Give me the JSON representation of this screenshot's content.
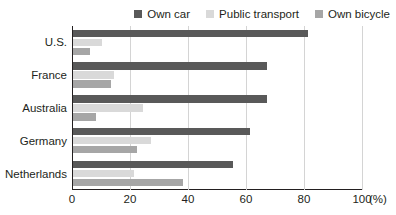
{
  "chart_data": {
    "type": "bar",
    "orientation": "horizontal",
    "title": "",
    "subtitle": "",
    "xlabel": "(%)",
    "ylabel": "",
    "xlim": [
      0,
      100
    ],
    "xticks": [
      0,
      20,
      40,
      60,
      80,
      100
    ],
    "xtick_labels": [
      "0",
      "20",
      "40",
      "60",
      "80",
      "100"
    ],
    "x_unit_label": "(%)",
    "grid": true,
    "grid_axis": "x",
    "legend_position": "top-right",
    "categories": [
      "U.S.",
      "France",
      "Australia",
      "Germany",
      "Netherlands"
    ],
    "series": [
      {
        "name": "Own car",
        "color": "#595959",
        "values": [
          81,
          67,
          67,
          61,
          55
        ]
      },
      {
        "name": "Public transport",
        "color": "#d9d9d9",
        "values": [
          10,
          14,
          24,
          27,
          21
        ]
      },
      {
        "name": "Own bicycle",
        "color": "#a6a6a6",
        "values": [
          6,
          13,
          8,
          22,
          38
        ]
      }
    ]
  },
  "colors": {
    "own_car": "#595959",
    "public_transport": "#d9d9d9",
    "own_bicycle": "#a6a6a6",
    "axis": "#231f20",
    "gridline": "#d4d4d4",
    "background": "#ffffff"
  }
}
